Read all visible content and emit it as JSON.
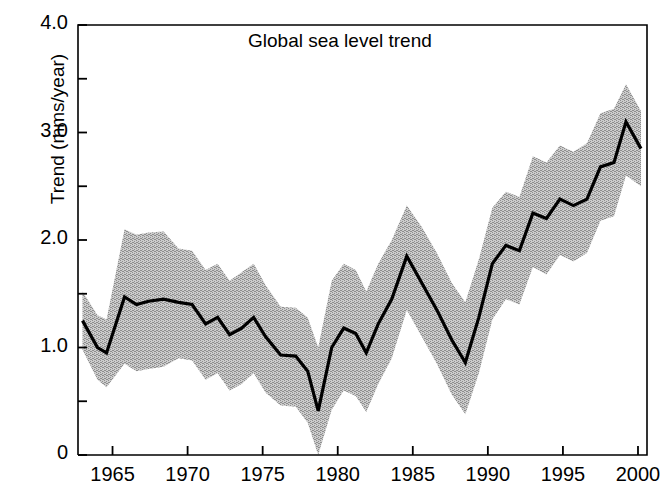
{
  "chart_data": {
    "type": "line",
    "title": "Global sea level trend",
    "xlabel": "",
    "ylabel": "Trend (mms/year)",
    "xlim": [
      1962.7,
      2000.6
    ],
    "ylim": [
      0,
      4.0
    ],
    "grid": false,
    "legend": "none",
    "y_ticks_major": [
      "0",
      "1.0",
      "2.0",
      "3.0",
      "4.0"
    ],
    "y_ticks_major_values": [
      0,
      1.0,
      2.0,
      3.0,
      4.0
    ],
    "y_ticks_minor_values": [
      0.5,
      1.5,
      2.5,
      3.5
    ],
    "x_ticks": [
      "1965",
      "1970",
      "1975",
      "1980",
      "1985",
      "1990",
      "1995",
      "2000"
    ],
    "x_ticks_values": [
      1965,
      1970,
      1975,
      1980,
      1985,
      1990,
      1995,
      2000
    ],
    "series": [
      {
        "name": "trend",
        "style": "line",
        "color": "#000000",
        "x": [
          1963.0,
          1964.0,
          1964.6,
          1965.8,
          1966.6,
          1967.4,
          1968.4,
          1969.4,
          1970.3,
          1971.2,
          1972.0,
          1972.8,
          1973.6,
          1974.4,
          1975.2,
          1976.2,
          1977.2,
          1978.0,
          1978.7,
          1979.6,
          1980.4,
          1981.2,
          1981.9,
          1982.7,
          1983.6,
          1984.6,
          1985.6,
          1986.6,
          1987.6,
          1988.5,
          1989.4,
          1990.3,
          1991.2,
          1992.1,
          1993.0,
          1993.9,
          1994.8,
          1995.7,
          1996.6,
          1997.5,
          1998.4,
          1999.2,
          2000.2
        ],
        "values": [
          1.25,
          1.0,
          0.95,
          1.47,
          1.4,
          1.43,
          1.45,
          1.42,
          1.4,
          1.22,
          1.28,
          1.12,
          1.18,
          1.28,
          1.1,
          0.93,
          0.92,
          0.78,
          0.41,
          1.0,
          1.18,
          1.13,
          0.95,
          1.22,
          1.45,
          1.85,
          1.6,
          1.35,
          1.07,
          0.86,
          1.28,
          1.78,
          1.95,
          1.9,
          2.25,
          2.2,
          2.38,
          2.32,
          2.38,
          2.68,
          2.72,
          3.1,
          2.85
        ]
      },
      {
        "name": "uncertainty-band-upper",
        "style": "band-edge",
        "color": "#b3b3b3",
        "x": [
          1963.0,
          1964.0,
          1964.6,
          1965.8,
          1966.6,
          1967.4,
          1968.4,
          1969.4,
          1970.3,
          1971.2,
          1972.0,
          1972.8,
          1973.6,
          1974.4,
          1975.2,
          1976.2,
          1977.2,
          1978.0,
          1978.7,
          1979.6,
          1980.4,
          1981.2,
          1981.9,
          1982.7,
          1983.6,
          1984.6,
          1985.6,
          1986.6,
          1987.6,
          1988.5,
          1989.4,
          1990.3,
          1991.2,
          1992.1,
          1993.0,
          1993.9,
          1994.8,
          1995.7,
          1996.6,
          1997.5,
          1998.4,
          1999.2,
          2000.2
        ],
        "values": [
          1.52,
          1.3,
          1.26,
          2.1,
          2.05,
          2.07,
          2.08,
          1.92,
          1.9,
          1.72,
          1.78,
          1.62,
          1.7,
          1.78,
          1.58,
          1.38,
          1.37,
          1.28,
          1.0,
          1.62,
          1.78,
          1.72,
          1.52,
          1.78,
          2.0,
          2.32,
          2.12,
          1.88,
          1.6,
          1.42,
          1.82,
          2.3,
          2.45,
          2.4,
          2.78,
          2.72,
          2.88,
          2.82,
          2.9,
          3.18,
          3.22,
          3.45,
          3.2
        ]
      },
      {
        "name": "uncertainty-band-lower",
        "style": "band-edge",
        "color": "#b3b3b3",
        "x": [
          1963.0,
          1964.0,
          1964.6,
          1965.8,
          1966.6,
          1967.4,
          1968.4,
          1969.4,
          1970.3,
          1971.2,
          1972.0,
          1972.8,
          1973.6,
          1974.4,
          1975.2,
          1976.2,
          1977.2,
          1978.0,
          1978.7,
          1979.6,
          1980.4,
          1981.2,
          1981.9,
          1982.7,
          1983.6,
          1984.6,
          1985.6,
          1986.6,
          1987.6,
          1988.5,
          1989.4,
          1990.3,
          1991.2,
          1992.1,
          1993.0,
          1993.9,
          1994.8,
          1995.7,
          1996.6,
          1997.5,
          1998.4,
          1999.2,
          2000.2
        ],
        "values": [
          0.98,
          0.7,
          0.63,
          0.85,
          0.78,
          0.8,
          0.82,
          0.9,
          0.88,
          0.7,
          0.76,
          0.6,
          0.66,
          0.76,
          0.58,
          0.46,
          0.45,
          0.3,
          0.0,
          0.42,
          0.6,
          0.55,
          0.4,
          0.66,
          0.9,
          1.35,
          1.1,
          0.85,
          0.56,
          0.38,
          0.76,
          1.26,
          1.45,
          1.4,
          1.75,
          1.68,
          1.86,
          1.8,
          1.88,
          2.18,
          2.22,
          2.6,
          2.5
        ]
      }
    ],
    "annotations": []
  }
}
